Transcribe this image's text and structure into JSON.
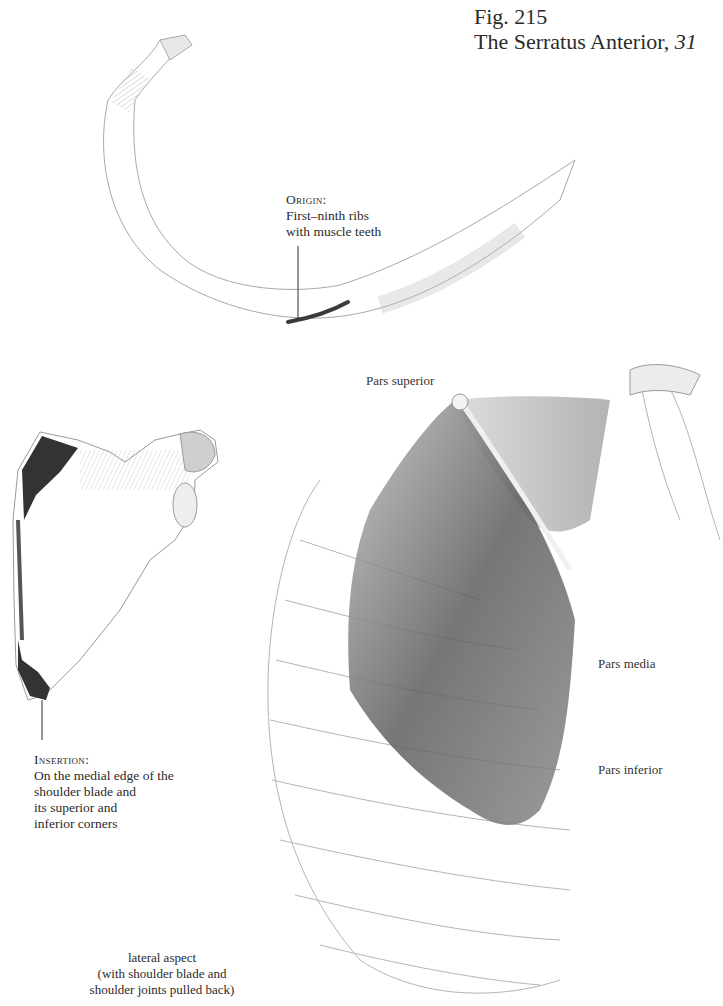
{
  "figure": {
    "number_label": "Fig. 215",
    "title": "The Serratus Anterior,",
    "title_number": "31"
  },
  "origin": {
    "heading": "Origin:",
    "lines": [
      "First–ninth ribs",
      "with muscle teeth"
    ]
  },
  "insertion": {
    "heading": "Insertion:",
    "lines": [
      "On the medial edge of the",
      "shoulder blade and",
      "its superior and",
      "inferior corners"
    ]
  },
  "parts": {
    "superior": "Pars superior",
    "media": "Pars media",
    "inferior": "Pars inferior"
  },
  "caption": {
    "lines": [
      "lateral aspect",
      "(with shoulder blade and",
      "shoulder joints pulled back)"
    ]
  },
  "colors": {
    "ink": "#2b2b2b",
    "pencil_line": "#9a9a9a",
    "muscle_shade": "#555555",
    "insertion_mark": "#2e2e2e"
  }
}
